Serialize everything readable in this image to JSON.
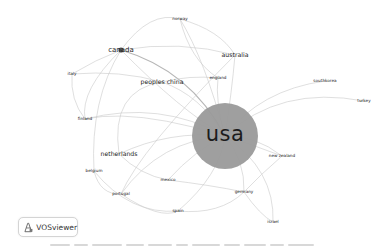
{
  "app": {
    "name": "VOSviewer",
    "logo_icon": "vosviewer-logo-icon"
  },
  "colors": {
    "edge": "#c9c9c9",
    "usa_node": "#9a9a9a",
    "label": "#1e1e1e",
    "background": "#ffffff"
  },
  "network": {
    "center_node": {
      "label": "usa",
      "x": 225,
      "y": 136,
      "r": 33
    },
    "nodes": [
      {
        "id": "norway",
        "label": "norway",
        "x": 180,
        "y": 19,
        "size": "small"
      },
      {
        "id": "canada",
        "label": "canada",
        "x": 121,
        "y": 50,
        "size": "big"
      },
      {
        "id": "australia",
        "label": "australia",
        "x": 235,
        "y": 55,
        "size": "medium"
      },
      {
        "id": "peoples-china",
        "label": "peoples china",
        "x": 162,
        "y": 82,
        "size": "medium"
      },
      {
        "id": "england",
        "label": "england",
        "x": 218,
        "y": 78,
        "size": "small"
      },
      {
        "id": "italy",
        "label": "italy",
        "x": 72,
        "y": 74,
        "size": "small"
      },
      {
        "id": "finland",
        "label": "finland",
        "x": 85,
        "y": 119,
        "size": "small"
      },
      {
        "id": "southkorea",
        "label": "southkorea",
        "x": 325,
        "y": 81,
        "size": "small"
      },
      {
        "id": "turkey",
        "label": "turkey",
        "x": 364,
        "y": 101,
        "size": "small"
      },
      {
        "id": "new-zealand",
        "label": "new zealand",
        "x": 282,
        "y": 156,
        "size": "small"
      },
      {
        "id": "netherlands",
        "label": "netherlands",
        "x": 119,
        "y": 154,
        "size": "medium"
      },
      {
        "id": "belgium",
        "label": "belgium",
        "x": 94,
        "y": 171,
        "size": "small"
      },
      {
        "id": "mexico",
        "label": "mexico",
        "x": 168,
        "y": 180,
        "size": "small"
      },
      {
        "id": "portugal",
        "label": "portugal",
        "x": 121,
        "y": 194,
        "size": "small"
      },
      {
        "id": "germany",
        "label": "germany",
        "x": 244,
        "y": 192,
        "size": "small"
      },
      {
        "id": "spain",
        "label": "spain",
        "x": 178,
        "y": 211,
        "size": "small"
      },
      {
        "id": "israel",
        "label": "israel",
        "x": 273,
        "y": 222,
        "size": "small"
      }
    ]
  }
}
